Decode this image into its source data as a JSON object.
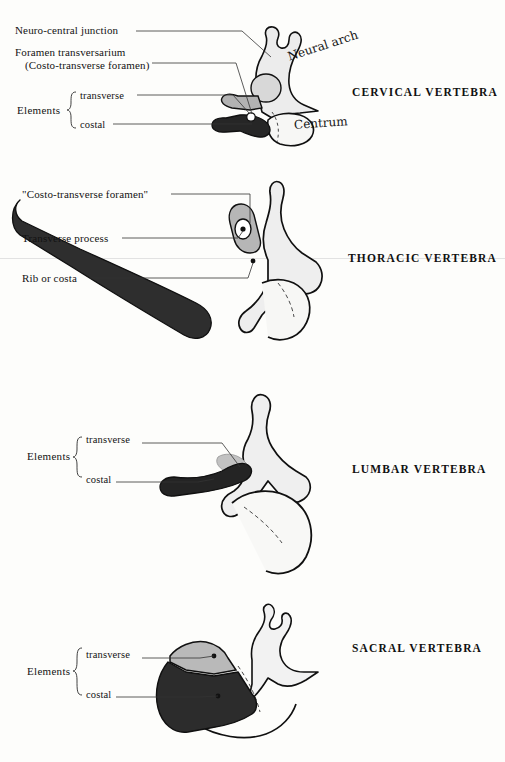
{
  "figure": {
    "background_color": "#fdfdfb",
    "ink_color": "#111111"
  },
  "palette": {
    "neural_arch_light": "#ededed",
    "transverse_element_gray": "#b4b4b4",
    "costal_element_dark": "#2b2b2b",
    "centrum_white": "#f7f7f5",
    "outline": "#101010",
    "leader_line": "#333333",
    "page_rule": "#e2e2e2"
  },
  "panels": [
    {
      "id": "cervical",
      "region_title": "CERVICAL VERTEBRA",
      "title_position": {
        "x": 352,
        "y": 86
      },
      "labels": [
        {
          "name": "neuro-central-junction",
          "text": "Neuro-central junction",
          "x": 15,
          "y": 30
        },
        {
          "name": "foramen-transversarium",
          "text": "Foramen transversarium",
          "x": 15,
          "y": 52
        },
        {
          "name": "costo-transverse-foramen-paren",
          "text": "(Costo-transverse foramen)",
          "x": 25,
          "y": 65
        },
        {
          "name": "elements-word",
          "text": "Elements",
          "x": 17,
          "y": 111
        },
        {
          "name": "elements-transverse",
          "text": "transverse",
          "x": 80,
          "y": 97
        },
        {
          "name": "elements-costal",
          "text": "costal",
          "x": 80,
          "y": 125
        }
      ],
      "handwritten_labels": [
        {
          "name": "neural-arch",
          "text": "Neural arch",
          "x": 290,
          "y": 60,
          "rotation": -18
        },
        {
          "name": "centrum",
          "text": "Centrum",
          "x": 295,
          "y": 128,
          "rotation": -4
        }
      ]
    },
    {
      "id": "thoracic",
      "region_title": "THORACIC VERTEBRA",
      "title_position": {
        "x": 348,
        "y": 254
      },
      "labels": [
        {
          "name": "costo-transverse-foramen-quoted",
          "text": "\"Costo-transverse foramen\"",
          "x": 22,
          "y": 194
        },
        {
          "name": "transverse-process",
          "text": "Transverse process",
          "x": 22,
          "y": 238
        },
        {
          "name": "rib-or-costa",
          "text": "Rib or costa",
          "x": 22,
          "y": 278
        }
      ],
      "handwritten_labels": []
    },
    {
      "id": "lumbar",
      "region_title": "LUMBAR VERTEBRA",
      "title_position": {
        "x": 352,
        "y": 463
      },
      "labels": [
        {
          "name": "elements-word",
          "text": "Elements",
          "x": 27,
          "y": 456
        },
        {
          "name": "elements-transverse",
          "text": "transverse",
          "x": 86,
          "y": 438
        },
        {
          "name": "elements-costal",
          "text": "costal",
          "x": 86,
          "y": 478
        }
      ],
      "handwritten_labels": []
    },
    {
      "id": "sacral",
      "region_title": "SACRAL VERTEBRA",
      "title_position": {
        "x": 352,
        "y": 648
      },
      "labels": [
        {
          "name": "elements-word",
          "text": "Elements",
          "x": 27,
          "y": 672
        },
        {
          "name": "elements-transverse",
          "text": "transverse",
          "x": 86,
          "y": 654
        },
        {
          "name": "elements-costal",
          "text": "costal",
          "x": 86,
          "y": 694
        }
      ],
      "handwritten_labels": []
    }
  ],
  "page_rule": {
    "name": "page-rule",
    "y": 258
  }
}
